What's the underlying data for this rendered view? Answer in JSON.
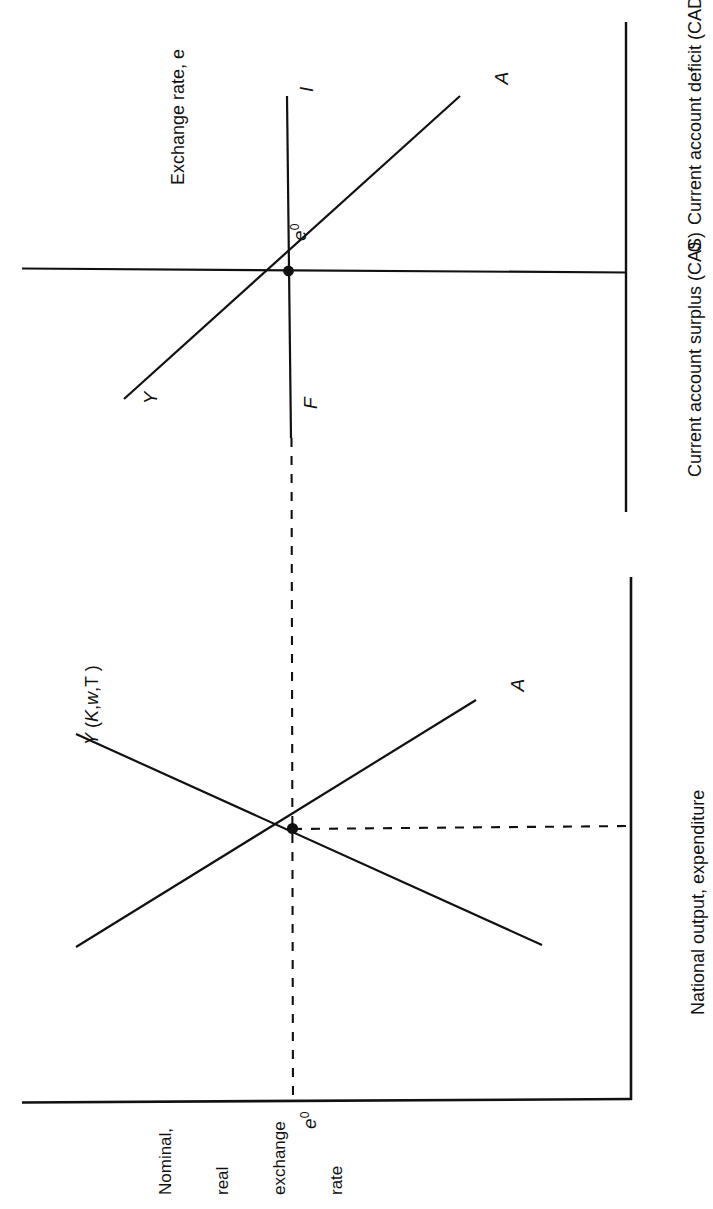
{
  "figure": {
    "type": "economics-diagram",
    "orientation": "rotated-90-counterclockwise",
    "background": "#ffffff",
    "ink_color": "#111111"
  },
  "panels": {
    "top": {
      "name": "balance-of-payments-panel",
      "vertical_axis_label": "Exchange rate, e",
      "horizontal_axis_label_left": "Current account surplus (CAS)",
      "horizontal_axis_label_origin": "0",
      "horizontal_axis_label_right": "Current account deficit (CAD)",
      "equilibrium_label": "e",
      "equilibrium_superscript": "0",
      "curves": [
        {
          "id": "YA-curve-top",
          "start_label": "Y",
          "end_label": "A"
        },
        {
          "id": "IF-line-top",
          "top_label": "I",
          "bottom_label": "F"
        }
      ]
    },
    "bottom": {
      "name": "goods-market-panel",
      "vertical_axis_label_lines": [
        "Nominal,",
        "real",
        "exchange",
        "rate"
      ],
      "horizontal_axis_label": "National output, expenditure",
      "equilibrium_label": "e",
      "equilibrium_superscript": "0",
      "curves": [
        {
          "id": "output-curve",
          "label": "Y (K,w,T )",
          "label_parts": [
            "Y",
            " (",
            "K",
            ",",
            "w",
            ",T )"
          ]
        },
        {
          "id": "absorption-curve",
          "label": "A"
        }
      ]
    }
  },
  "chart_data": {
    "type": "line",
    "title": "",
    "xlabel": "Current account surplus (CAS)  0  Current account deficit (CAD)",
    "ylabel": "Exchange rate, e",
    "grid": false,
    "legend": "none",
    "annotations": [
      "I",
      "F",
      "Y",
      "A",
      "e0",
      "Y (K,w,T )",
      "A"
    ],
    "series": [
      {
        "name": "Y",
        "points": [
          [
            -1.0,
            -0.55
          ],
          [
            0,
            0
          ],
          [
            0.65,
            0.52
          ]
        ],
        "label_at_start": "Y",
        "label_at_end": "A"
      },
      {
        "name": "IF",
        "points": [
          [
            0,
            0.62
          ],
          [
            0,
            -0.62
          ]
        ],
        "label_at_start": "I",
        "label_at_end": "F"
      },
      {
        "name": "Y (K,w,T )",
        "points": [
          [
            -0.86,
            0.58
          ],
          [
            0,
            0
          ],
          [
            0.68,
            -0.62
          ]
        ]
      },
      {
        "name": "A",
        "points": [
          [
            -0.86,
            -0.62
          ],
          [
            0,
            0
          ],
          [
            0.62,
            0.5
          ]
        ]
      }
    ],
    "markers": [
      {
        "name": "equilibrium-top",
        "x": 0,
        "y": 0,
        "label": "e0"
      },
      {
        "name": "equilibrium-bottom",
        "x": 0,
        "y": 0,
        "label": "e0"
      }
    ]
  },
  "labels": {
    "exchange_rate_axis": "Exchange rate, e",
    "cas": "Current account surplus (CAS)",
    "zero": "0",
    "cad": "Current account deficit (CAD)",
    "national_output": "National output, expenditure",
    "nominal_line1": "Nominal,",
    "nominal_line2": "real",
    "nominal_line3": "exchange",
    "nominal_line4": "rate",
    "I": "I",
    "F": "F",
    "Y": "Y",
    "A": "A",
    "A2": "A",
    "e_base": "e",
    "e_sup": "0",
    "yfn_Y": "Y",
    "yfn_open": " (",
    "yfn_K": "K",
    "yfn_comma": ",",
    "yfn_w": "w",
    "yfn_rest": ",T )"
  }
}
